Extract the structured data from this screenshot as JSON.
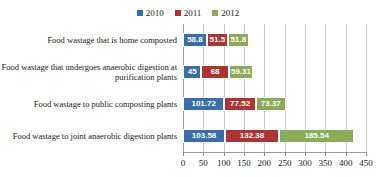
{
  "chart_data": {
    "type": "bar",
    "orientation": "horizontal",
    "stacked": true,
    "title": "",
    "subtitle": "",
    "xlabel": "",
    "ylabel": "",
    "xlim": [
      0,
      450
    ],
    "xticks": [
      0,
      50,
      100,
      150,
      200,
      250,
      300,
      350,
      400,
      450
    ],
    "grid": true,
    "legend_position": "top-center",
    "categories": [
      "Food wastage that is home composted",
      "Food wastage that undergoes anaerobic digestion at purification plants",
      "Food wastage to public composting plants",
      "Food wastage to joint anaerobic digestion plants"
    ],
    "series": [
      {
        "name": "2010",
        "color": "#3a6ea5",
        "values": [
          58.8,
          45,
          101.72,
          103.58
        ],
        "labels": [
          "58.8",
          "45",
          "101.72",
          "103.58"
        ]
      },
      {
        "name": "2011",
        "color": "#ab3434",
        "values": [
          51.5,
          68,
          77.52,
          132.38
        ],
        "labels": [
          "51.5",
          "68",
          "77.52",
          "132.38"
        ]
      },
      {
        "name": "2012",
        "color": "#8aab5a",
        "values": [
          51.8,
          59.31,
          73.37,
          185.54
        ],
        "labels": [
          "51.8",
          "59.31",
          "73.37",
          "185.54"
        ]
      }
    ]
  }
}
